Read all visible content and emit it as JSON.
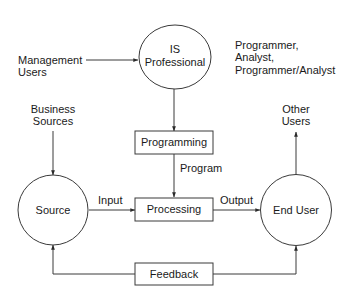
{
  "diagram": {
    "nodes": {
      "is_professional": {
        "line1": "IS",
        "line2": "Professional",
        "shape": "circle"
      },
      "source": {
        "label": "Source",
        "shape": "circle"
      },
      "end_user": {
        "label": "End User",
        "shape": "circle"
      },
      "programming": {
        "label": "Programming",
        "shape": "box"
      },
      "processing": {
        "label": "Processing",
        "shape": "box"
      },
      "feedback": {
        "label": "Feedback",
        "shape": "box"
      }
    },
    "external_labels": {
      "management_users": {
        "line1": "Management",
        "line2": "Users"
      },
      "business_sources": {
        "line1": "Business",
        "line2": "Sources"
      },
      "other_users": {
        "line1": "Other",
        "line2": "Users"
      },
      "roles": {
        "line1": "Programmer,",
        "line2": "Analyst,",
        "line3": "Programmer/Analyst"
      }
    },
    "edge_labels": {
      "program": "Program",
      "input": "Input",
      "output": "Output"
    },
    "edges": [
      {
        "from": "Management Users",
        "to": "IS Professional",
        "label": ""
      },
      {
        "from": "IS Professional",
        "to": "Programming",
        "label": ""
      },
      {
        "from": "Programming",
        "to": "Processing",
        "label": "Program"
      },
      {
        "from": "Business Sources",
        "to": "Source",
        "label": ""
      },
      {
        "from": "Source",
        "to": "Processing",
        "label": "Input"
      },
      {
        "from": "Processing",
        "to": "End User",
        "label": "Output"
      },
      {
        "from": "End User",
        "to": "Other Users",
        "label": ""
      },
      {
        "from": "Feedback",
        "to": "Source",
        "label": ""
      },
      {
        "from": "Feedback",
        "to": "End User",
        "label": ""
      }
    ],
    "colors": {
      "stroke": "#3a3a3a",
      "text": "#1a1a1a",
      "background": "#ffffff"
    }
  }
}
